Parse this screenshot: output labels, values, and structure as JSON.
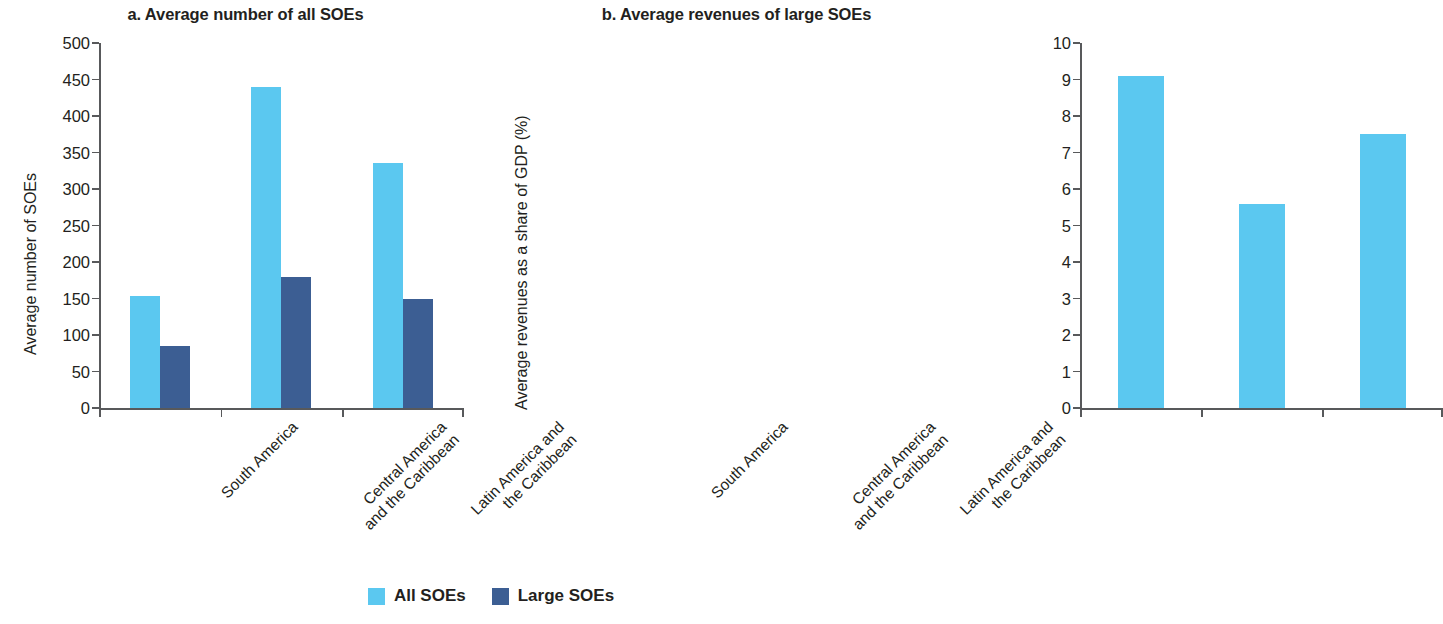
{
  "chart_data": [
    {
      "type": "bar",
      "panel": "a",
      "title": "a. Average number of all SOEs",
      "xlabel": "",
      "ylabel": "Average number of SOEs",
      "ylim": [
        0,
        500
      ],
      "ytick_step": 50,
      "yticks": [
        "500",
        "450",
        "400",
        "350",
        "300",
        "250",
        "200",
        "150",
        "100",
        "50",
        "0"
      ],
      "grid": false,
      "legend_position": "bottom",
      "categories": [
        "South America",
        "Central America and the Caribbean",
        "Latin America and the Caribbean"
      ],
      "category_lines": [
        [
          "South America"
        ],
        [
          "Central America",
          "and the Caribbean"
        ],
        [
          "Latin America and",
          "the Caribbean"
        ]
      ],
      "series": [
        {
          "name": "All SOEs",
          "color": "#5bc8f0",
          "values": [
            153,
            440,
            335
          ]
        },
        {
          "name": "Large SOEs",
          "color": "#3c5e93",
          "values": [
            85,
            180,
            150
          ]
        }
      ]
    },
    {
      "type": "bar",
      "panel": "b",
      "title": "b. Average revenues of large SOEs",
      "xlabel": "",
      "ylabel": "Average revenues as a share of GDP (%)",
      "ylim": [
        0,
        10
      ],
      "ytick_step": 1,
      "yticks": [
        "10",
        "9",
        "8",
        "7",
        "6",
        "5",
        "4",
        "3",
        "2",
        "1",
        "0"
      ],
      "grid": false,
      "legend_position": "bottom",
      "categories": [
        "South America",
        "Central America and the Caribbean",
        "Latin America and the Caribbean"
      ],
      "category_lines": [
        [
          "South America"
        ],
        [
          "Central America",
          "and the Caribbean"
        ],
        [
          "Latin America and",
          "the Caribbean"
        ]
      ],
      "series": [
        {
          "name": "Large SOEs",
          "color": "#5bc8f0",
          "values": [
            9.1,
            5.6,
            7.5
          ]
        }
      ]
    }
  ],
  "legend": {
    "items": [
      {
        "label": "All SOEs",
        "color": "#5bc8f0"
      },
      {
        "label": "Large SOEs",
        "color": "#3c5e93"
      }
    ]
  },
  "colors": {
    "all_soes": "#5bc8f0",
    "large_soes": "#3c5e93",
    "axis": "#58595b",
    "text": "#231f20",
    "background": "#ffffff"
  }
}
